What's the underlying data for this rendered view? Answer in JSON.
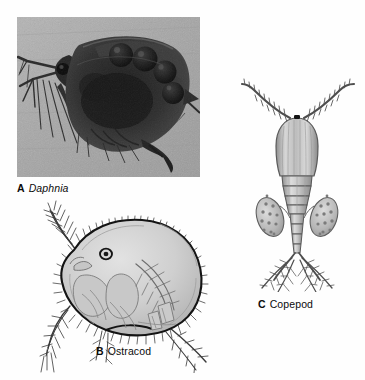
{
  "figure": {
    "background_color": "#fefefe",
    "panels": [
      {
        "letter": "A",
        "name": "Daphnia",
        "italic": true,
        "media": "photograph",
        "subject": "water flea with eggs in brood chamber",
        "photo_background_color": "#a9a9a9",
        "body_color": "#2b2b2b"
      },
      {
        "letter": "B",
        "name": "Ostracod",
        "italic": false,
        "media": "line drawing",
        "subject": "seed shrimp with bivalved carapace and marginal setae",
        "shell_color": "#d2d2d2",
        "outline_color": "#1a1a1a"
      },
      {
        "letter": "C",
        "name": "Copepod",
        "italic": false,
        "media": "line drawing",
        "subject": "copepod with paired egg sacs, long antennae and caudal rami",
        "body_color": "#b9b9b9",
        "outline_color": "#4a4a4a"
      }
    ]
  },
  "captions": {
    "a": {
      "letter": "A",
      "name": "Daphnia"
    },
    "b": {
      "letter": "B",
      "name": "Ostracod"
    },
    "c": {
      "letter": "C",
      "name": "Copepod"
    }
  }
}
